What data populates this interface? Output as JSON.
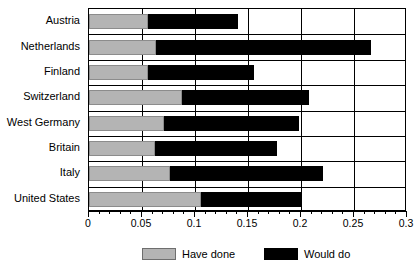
{
  "chart_data": {
    "type": "bar",
    "orientation": "horizontal",
    "title": "",
    "subtitle": "",
    "xlabel": "",
    "ylabel": "",
    "xlim": [
      0,
      0.3
    ],
    "xticks": [
      0,
      0.05,
      0.1,
      0.15,
      0.2,
      0.25,
      0.3
    ],
    "xtick_labels": [
      "0",
      "0.05",
      "0.1",
      "0.15",
      "0.2",
      "0.25",
      "0.3"
    ],
    "minor_tick_step": 0.01,
    "grid": "vertical",
    "legend_position": "bottom",
    "categories": [
      "Austria",
      "Netherlands",
      "Finland",
      "Switzerland",
      "West Germany",
      "Britain",
      "Italy",
      "United States"
    ],
    "series": [
      {
        "name": "Have done",
        "color": "#b4b4b4",
        "values": [
          0.056,
          0.063,
          0.056,
          0.088,
          0.071,
          0.062,
          0.076,
          0.106
        ]
      },
      {
        "name": "Would do",
        "color": "#000000",
        "values": [
          0.141,
          0.266,
          0.156,
          0.208,
          0.198,
          0.177,
          0.22,
          0.2
        ]
      }
    ],
    "note": "Stacked horizontal bars: 'Have done' segment starts at 0, 'Would do' segment ends at the listed cumulative value."
  },
  "legend": {
    "items": [
      {
        "label": "Have done",
        "swatch": "gray-swatch"
      },
      {
        "label": "Would do",
        "swatch": "black-swatch"
      }
    ]
  }
}
